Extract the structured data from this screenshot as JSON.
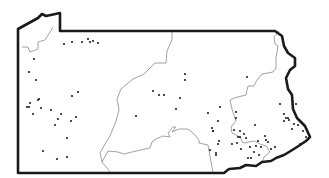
{
  "map": {
    "subject": "Pennsylvania",
    "colors": {
      "outline": "#1a1a1a",
      "regions": "#8a8a8a",
      "dots": "#222222",
      "background": "#ffffff"
    },
    "dot_radius": 1.1,
    "state_outline": "M18,29 L38,18 L42,14 L46,16 L60,13 L60,31 L275,31 L282,36 L284,46 L288,53 L295,58 L295,66 L290,70 L286,78 L288,89 L292,95 L293,109 L297,118 L305,126 L310,137 L306,141 L297,147 L289,152 L284,155 L276,158 L271,161 L262,162 L256,166 L246,165 L240,168 L229,169 L224,173 L18,173 Z",
    "region_lines": [
      "M22,47 L28,47 L30,52 L38,49 L38,42 L45,40 L50,32 L53,27",
      "M111,173 L102,162 L100,153 L105,144 L110,136 L116,121 L119,110 L117,99 L121,89 L133,79 L144,74 L155,63 L166,63 L167,51 L172,40 L172,31",
      "M102,162 L108,151 L118,152 L124,154 L136,151 L150,148 L152,142 L156,139 L163,136 L170,137 L168,133 L173,127 L176,127 L172,132 L179,129 L188,129 L193,133 L199,140 L199,143 L208,145 L213,173",
      "M279,31 L274,37 L275,44 L278,46 L276,58 L276,68 L273,72 L262,74 L257,80 L254,86 L248,86 L246,95 L234,98 L230,100 L232,109 L234,115 L236,121 L231,127 L232,133 L240,137 L243,143 L254,141 L260,144 L266,146 L270,152 L264,157 L262,162"
    ],
    "sites": [
      [
        29,
        72
      ],
      [
        34,
        59
      ],
      [
        64,
        44
      ],
      [
        72,
        42
      ],
      [
        82,
        42
      ],
      [
        88,
        39
      ],
      [
        90,
        42
      ],
      [
        93,
        41
      ],
      [
        98,
        43
      ],
      [
        36,
        80
      ],
      [
        38,
        100
      ],
      [
        30,
        103
      ],
      [
        27,
        107
      ],
      [
        29,
        107
      ],
      [
        39,
        99
      ],
      [
        41,
        108
      ],
      [
        33,
        114
      ],
      [
        51,
        110
      ],
      [
        58,
        119
      ],
      [
        61,
        114
      ],
      [
        72,
        96
      ],
      [
        78,
        92
      ],
      [
        71,
        121
      ],
      [
        76,
        117
      ],
      [
        55,
        125
      ],
      [
        43,
        151
      ],
      [
        57,
        159
      ],
      [
        67,
        157
      ],
      [
        67,
        138
      ],
      [
        136,
        116
      ],
      [
        153,
        91
      ],
      [
        164,
        95
      ],
      [
        185,
        74
      ],
      [
        185,
        80
      ],
      [
        159,
        95
      ],
      [
        176,
        109
      ],
      [
        180,
        98
      ],
      [
        208,
        113
      ],
      [
        247,
        77
      ],
      [
        212,
        128
      ],
      [
        213,
        131
      ],
      [
        210,
        150
      ],
      [
        220,
        107
      ],
      [
        218,
        121
      ],
      [
        213,
        131
      ],
      [
        219,
        141
      ],
      [
        218,
        144
      ],
      [
        216,
        153
      ],
      [
        216,
        155
      ],
      [
        236,
        112
      ],
      [
        234,
        130
      ],
      [
        236,
        118
      ],
      [
        240,
        131
      ],
      [
        240,
        137
      ],
      [
        232,
        144
      ],
      [
        237,
        143
      ],
      [
        238,
        137
      ],
      [
        244,
        134
      ],
      [
        246,
        138
      ],
      [
        241,
        149
      ],
      [
        255,
        125
      ],
      [
        250,
        147
      ],
      [
        248,
        158
      ],
      [
        251,
        158
      ],
      [
        258,
        141
      ],
      [
        256,
        146
      ],
      [
        261,
        147
      ],
      [
        265,
        136
      ],
      [
        266,
        140
      ],
      [
        268,
        142
      ],
      [
        259,
        155
      ],
      [
        254,
        152
      ],
      [
        271,
        149
      ],
      [
        275,
        147
      ],
      [
        300,
        144
      ],
      [
        306,
        137
      ],
      [
        280,
        104
      ],
      [
        284,
        114
      ],
      [
        286,
        118
      ],
      [
        289,
        120
      ],
      [
        284,
        121
      ],
      [
        294,
        124
      ],
      [
        296,
        104
      ],
      [
        298,
        125
      ],
      [
        292,
        129
      ],
      [
        303,
        131
      ],
      [
        288,
        118
      ]
    ]
  }
}
